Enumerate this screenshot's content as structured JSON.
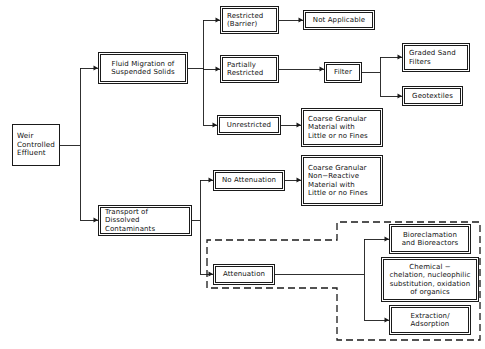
{
  "diagram": {
    "line_color": "#1a1a1a",
    "background": "#ffffff",
    "dashed_group_label": "attenuation-treatment-group"
  },
  "nodes": {
    "root": {
      "id": "weir-controlled-effluent",
      "label": "Weir\nControlled\nEffluent",
      "x": 12,
      "y": 124,
      "w": 48,
      "h": 42,
      "font_size": 7.2,
      "align": "left",
      "style": "plain"
    },
    "fluid_migration": {
      "id": "fluid-migration-of-suspended-solids",
      "label": "Fluid Migration of\nSuspended Solids",
      "x": 100,
      "y": 54,
      "w": 86,
      "h": 28,
      "font_size": 7.0,
      "align": "center",
      "style": "shadowed"
    },
    "transport_dissolved": {
      "id": "transport-of-dissolved-contaminants",
      "label": "Transport of\nDissolved Contaminants",
      "x": 100,
      "y": 207,
      "w": 90,
      "h": 27,
      "font_size": 7.0,
      "align": "left",
      "style": "shadowed"
    },
    "restricted": {
      "id": "restricted-barrier",
      "label": "Restricted\n(Barrier)",
      "x": 222,
      "y": 8,
      "w": 55,
      "h": 24,
      "font_size": 7.0,
      "align": "left",
      "style": "shadowed"
    },
    "partially_restricted": {
      "id": "partially-restricted",
      "label": "Partially\nRestricted",
      "x": 222,
      "y": 57,
      "w": 55,
      "h": 24,
      "font_size": 7.0,
      "align": "left",
      "style": "shadowed"
    },
    "unrestricted": {
      "id": "unrestricted",
      "label": "Unrestricted",
      "x": 219,
      "y": 117,
      "w": 60,
      "h": 16,
      "font_size": 7.0,
      "align": "center",
      "style": "shadowed"
    },
    "not_applicable": {
      "id": "not-applicable",
      "label": "Not Applicable",
      "x": 305,
      "y": 12,
      "w": 68,
      "h": 16,
      "font_size": 7.0,
      "align": "center",
      "style": "shadowed"
    },
    "filter": {
      "id": "filter",
      "label": "Filter",
      "x": 326,
      "y": 64,
      "w": 34,
      "h": 17,
      "font_size": 7.0,
      "align": "center",
      "style": "shadowed"
    },
    "graded_sand_filters": {
      "id": "graded-sand-filters",
      "label": "Graded Sand\nFilters",
      "x": 404,
      "y": 45,
      "w": 64,
      "h": 25,
      "font_size": 7.0,
      "align": "left",
      "style": "shadowed"
    },
    "geotextiles": {
      "id": "geotextiles",
      "label": "Geotextiles",
      "x": 404,
      "y": 88,
      "w": 57,
      "h": 16,
      "font_size": 7.0,
      "align": "center",
      "style": "shadowed"
    },
    "coarse_granular_fines": {
      "id": "coarse-granular-material-with-little-or-no-fines",
      "label": "Coarse Granular\nMaterial with\nLittle or no Fines",
      "x": 303,
      "y": 110,
      "w": 78,
      "h": 35,
      "font_size": 7.0,
      "align": "left",
      "style": "shadowed"
    },
    "no_attenuation": {
      "id": "no-attenuation",
      "label": "No Attenuation",
      "x": 215,
      "y": 172,
      "w": 68,
      "h": 17,
      "font_size": 7.0,
      "align": "center",
      "style": "shadowed"
    },
    "coarse_granular_nonreactive": {
      "id": "coarse-granular-non-reactive-material-with-little-or-no-fines",
      "label": "Coarse Granular\nNon−Reactive\nMaterial with\nLittle or no Fines",
      "x": 303,
      "y": 157,
      "w": 78,
      "h": 47,
      "font_size": 7.0,
      "align": "left",
      "style": "shadowed"
    },
    "attenuation": {
      "id": "attenuation",
      "label": "Attenuation",
      "x": 215,
      "y": 266,
      "w": 58,
      "h": 17,
      "font_size": 7.0,
      "align": "center",
      "style": "shadowed"
    },
    "bioreclamation": {
      "id": "bioreclamation-and-bioreactors",
      "label": "Bioreclamation\nand Bioreactors",
      "x": 391,
      "y": 226,
      "w": 78,
      "h": 26,
      "font_size": 7.0,
      "align": "center",
      "style": "shadowed"
    },
    "chemical": {
      "id": "chemical-treatment",
      "label": "Chemical −\nchelation, nucleophilic\nsubstitution, oxidation\nof organics",
      "x": 383,
      "y": 259,
      "w": 94,
      "h": 41,
      "font_size": 7.0,
      "align": "center",
      "style": "shadowed"
    },
    "extraction": {
      "id": "extraction-adsorption",
      "label": "Extraction/\nAdsorption",
      "x": 391,
      "y": 307,
      "w": 78,
      "h": 26,
      "font_size": 7.0,
      "align": "center",
      "style": "shadowed"
    }
  },
  "connectors": {
    "paths": [
      "M60,145 L80,145",
      "M80,145 L80,68 L98,68",
      "M80,145 L80,220 L98,220",
      "M186,68 L203,68",
      "M203,68 L203,20 L220,20",
      "M203,68 L203,69 L220,69",
      "M203,68 L203,125 L217,125",
      "M277,20 L303,20",
      "M277,69 L324,69",
      "M360,72 L380,72",
      "M380,72 L380,57 L402,57",
      "M380,72 L380,96 L402,96",
      "M279,125 L301,125",
      "M190,220 L200,220",
      "M200,220 L200,180 L213,180",
      "M200,220 L200,274 L213,274",
      "M283,180 L301,180",
      "M273,274 L364,274",
      "M364,274 L364,239 L389,239",
      "M364,274 L364,320 L389,320"
    ],
    "arrow_tips": [
      {
        "x": 98,
        "y": 68
      },
      {
        "x": 98,
        "y": 220
      },
      {
        "x": 220,
        "y": 20
      },
      {
        "x": 220,
        "y": 69
      },
      {
        "x": 217,
        "y": 125
      },
      {
        "x": 303,
        "y": 20
      },
      {
        "x": 324,
        "y": 69
      },
      {
        "x": 402,
        "y": 57
      },
      {
        "x": 402,
        "y": 96
      },
      {
        "x": 301,
        "y": 125
      },
      {
        "x": 213,
        "y": 180
      },
      {
        "x": 213,
        "y": 274
      },
      {
        "x": 301,
        "y": 180
      },
      {
        "x": 389,
        "y": 239
      },
      {
        "x": 389,
        "y": 274
      },
      {
        "x": 389,
        "y": 320
      }
    ],
    "dashed_outline": "M207,265 L207,240 L337,240 L337,222 L480,222 L480,340 L337,340 L337,288 L207,288 Z"
  }
}
